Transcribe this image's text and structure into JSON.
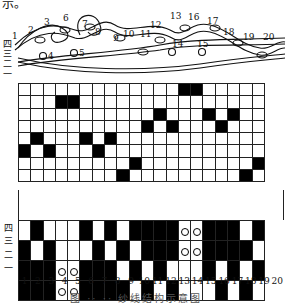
{
  "header_fragment": "示。",
  "weave_illustration": {
    "thread_numbers": [
      "1",
      "2",
      "3",
      "6",
      "7",
      "8",
      "9",
      "10",
      "11",
      "12",
      "13",
      "16",
      "17",
      "18",
      "19",
      "20"
    ],
    "ring_markers": [
      "4",
      "5",
      "14",
      "15"
    ],
    "side_labels": [
      "四",
      "三",
      "二",
      "一"
    ]
  },
  "draft_grid": {
    "rows": 8,
    "cols": 20,
    "filled": [
      [
        14,
        15
      ],
      [
        4,
        5
      ],
      [
        12,
        16,
        18
      ],
      [
        11,
        13,
        17
      ],
      [
        2,
        6,
        8
      ],
      [
        1,
        3,
        7
      ],
      [
        10,
        20
      ],
      [
        9,
        19
      ]
    ]
  },
  "tieup_grid": {
    "row_labels": [
      "四",
      "三",
      "二",
      "一"
    ],
    "cells": [
      [
        "w",
        "b",
        "w",
        "w",
        "w",
        "b",
        "w",
        "b",
        "w",
        "b",
        "b",
        "b",
        "b",
        "o",
        "o",
        "b",
        "b",
        "b",
        "w",
        "b"
      ],
      [
        "b",
        "w",
        "b",
        "w",
        "w",
        "w",
        "b",
        "w",
        "b",
        "w",
        "b",
        "b",
        "b",
        "o",
        "o",
        "b",
        "b",
        "b",
        "b",
        "w"
      ],
      [
        "b",
        "b",
        "b",
        "o",
        "o",
        "b",
        "b",
        "b",
        "w",
        "b",
        "w",
        "b",
        "w",
        "w",
        "w",
        "b",
        "w",
        "b",
        "w",
        "b"
      ],
      [
        "b",
        "b",
        "b",
        "o",
        "o",
        "b",
        "b",
        "b",
        "b",
        "w",
        "b",
        "w",
        "b",
        "w",
        "w",
        "w",
        "b",
        "w",
        "b",
        "w"
      ]
    ]
  },
  "column_numbers": [
    "1",
    "2",
    "3",
    "4",
    "5",
    "6",
    "7",
    "8",
    "9",
    "10",
    "11",
    "12",
    "13",
    "14",
    "15",
    "16",
    "17",
    "18",
    "19",
    "20"
  ],
  "caption": "图 ·· ·· 纱线结构示意图"
}
